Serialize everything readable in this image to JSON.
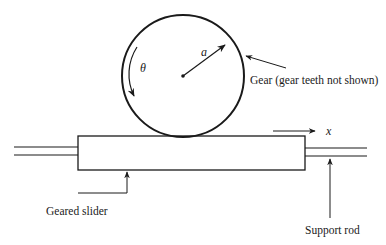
{
  "diagram": {
    "labels": {
      "gear": "Gear (gear teeth not shown)",
      "geared_slider": "Geared slider",
      "support_rod": "Support rod",
      "radius": "a",
      "angle": "θ",
      "displacement": "x"
    },
    "components": {
      "gear": {
        "shape": "circle",
        "center": [
          183,
          76
        ],
        "radius": 61
      },
      "slider": {
        "shape": "rectangle",
        "x": 78,
        "y": 136,
        "width": 227,
        "height": 34
      },
      "left_rod": {
        "x1": 14,
        "x2": 78,
        "y_top": 147,
        "y_bottom": 155
      },
      "right_rod": {
        "x1": 305,
        "x2": 367,
        "y_top": 148,
        "y_bottom": 156
      }
    },
    "colors": {
      "stroke": "#1a1a1a",
      "background": "#ffffff"
    }
  }
}
